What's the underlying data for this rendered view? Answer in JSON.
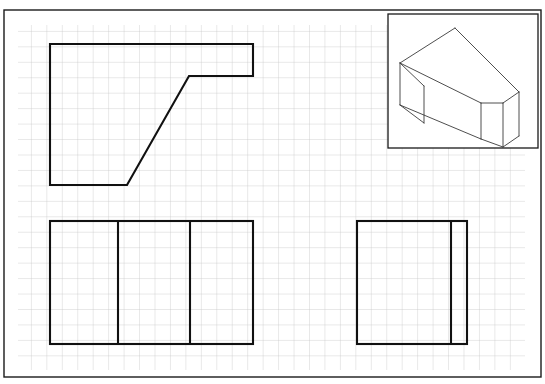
{
  "sheet": {
    "background_color": "#ffffff",
    "border_color": "#1a1a1a",
    "grid_color": "#c9c9c9",
    "line_color": "#111111",
    "iso_line_color": "#3a3a3a",
    "width": 545,
    "height": 384,
    "frame": {
      "x": 4,
      "y": 10,
      "width": 537,
      "height": 367
    },
    "grid": {
      "x": 18,
      "y": 25,
      "width": 507,
      "height": 345,
      "cell_size": 15.45,
      "columns": 33,
      "rows": 22
    }
  },
  "drawing": {
    "type": "orthographic-projection-worksheet",
    "projection": "third-angle",
    "views": [
      {
        "id": "top-view",
        "name": "top-view",
        "shape": "l-shaped-polygon-with-chamfer",
        "stroke_width": 2.1,
        "points": "50,44 253,44 253,76 189,76 127,185 50,185",
        "closed": true,
        "internal_lines": []
      },
      {
        "id": "front-view",
        "name": "front-view",
        "shape": "rectangle-with-two-vertical-dividers",
        "stroke_width": 2.1,
        "rect": {
          "x": 50,
          "y": 221,
          "width": 203,
          "height": 123
        },
        "internal_lines": [
          {
            "x1": 118,
            "y1": 221,
            "x2": 118,
            "y2": 344
          },
          {
            "x1": 190,
            "y1": 221,
            "x2": 190,
            "y2": 344
          }
        ]
      },
      {
        "id": "side-view",
        "name": "side-view",
        "shape": "rectangle-with-one-vertical-divider",
        "stroke_width": 2.1,
        "rect": {
          "x": 357,
          "y": 221,
          "width": 110,
          "height": 123
        },
        "internal_lines": [
          {
            "x1": 451,
            "y1": 221,
            "x2": 451,
            "y2": 344
          }
        ]
      }
    ],
    "pictorial": {
      "id": "isometric-view",
      "name": "isometric-pictorial-view",
      "stroke_width": 0.9,
      "box": {
        "x": 388,
        "y": 14,
        "width": 150,
        "height": 134
      },
      "outline": "455,28 519,92 519,136 503,147 503,103 481,103 481,139 400,105 400,63",
      "edges": [
        {
          "x1": 455,
          "y1": 28,
          "x2": 519,
          "y2": 92
        },
        {
          "x1": 519,
          "y1": 92,
          "x2": 519,
          "y2": 136
        },
        {
          "x1": 519,
          "y1": 136,
          "x2": 503,
          "y2": 147
        },
        {
          "x1": 503,
          "y1": 147,
          "x2": 503,
          "y2": 103
        },
        {
          "x1": 503,
          "y1": 103,
          "x2": 519,
          "y2": 92
        },
        {
          "x1": 503,
          "y1": 103,
          "x2": 481,
          "y2": 103
        },
        {
          "x1": 481,
          "y1": 103,
          "x2": 481,
          "y2": 139
        },
        {
          "x1": 481,
          "y1": 139,
          "x2": 503,
          "y2": 147
        },
        {
          "x1": 481,
          "y1": 103,
          "x2": 400,
          "y2": 63
        },
        {
          "x1": 400,
          "y1": 63,
          "x2": 455,
          "y2": 28
        },
        {
          "x1": 400,
          "y1": 63,
          "x2": 400,
          "y2": 105
        },
        {
          "x1": 400,
          "y1": 105,
          "x2": 481,
          "y2": 139
        },
        {
          "x1": 400,
          "y1": 105,
          "x2": 424,
          "y2": 123
        },
        {
          "x1": 424,
          "y1": 123,
          "x2": 424,
          "y2": 86
        },
        {
          "x1": 424,
          "y1": 86,
          "x2": 400,
          "y2": 63
        }
      ]
    }
  }
}
